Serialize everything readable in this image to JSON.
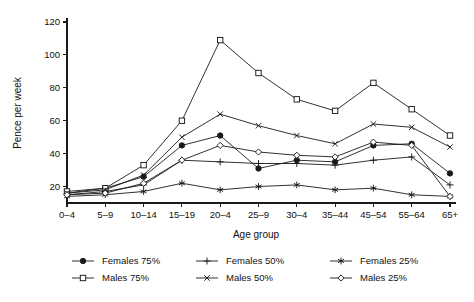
{
  "chart_data": {
    "type": "line",
    "title": "",
    "xlabel": "Age group",
    "ylabel": "Pence per week",
    "categories": [
      "0–4",
      "5–9",
      "10–14",
      "15–19",
      "20–4",
      "25–9",
      "30–4",
      "35–44",
      "45–54",
      "55–64",
      "65+"
    ],
    "ylim": [
      10,
      120
    ],
    "yticks": [
      20,
      40,
      60,
      80,
      100,
      120
    ],
    "ytick_labels": [
      "20",
      "40",
      "60",
      "80",
      "100",
      "120"
    ],
    "grid": false,
    "legend_position": "bottom",
    "series": [
      {
        "name": "Females 75%",
        "marker": "filled-circle",
        "values": [
          16,
          19,
          26,
          45,
          51,
          31,
          36,
          35,
          45,
          46,
          28
        ]
      },
      {
        "name": "Males 75%",
        "marker": "open-square",
        "values": [
          17,
          19,
          33,
          60,
          109,
          89,
          73,
          66,
          83,
          67,
          51
        ]
      },
      {
        "name": "Females 50%",
        "marker": "plus",
        "values": [
          15,
          17,
          21,
          36,
          35,
          34,
          34,
          33,
          36,
          38,
          21
        ]
      },
      {
        "name": "Males 50%",
        "marker": "cross",
        "values": [
          16,
          18,
          27,
          50,
          64,
          57,
          51,
          46,
          58,
          56,
          44
        ]
      },
      {
        "name": "Females 25%",
        "marker": "asterisk",
        "values": [
          14,
          15,
          17,
          22,
          18,
          20,
          21,
          18,
          19,
          15,
          14
        ]
      },
      {
        "name": "Males 25%",
        "marker": "open-diamond",
        "values": [
          15,
          16,
          22,
          36,
          45,
          41,
          39,
          38,
          47,
          45,
          14
        ]
      }
    ]
  },
  "legend": {
    "entries": [
      {
        "label": "Females 75%"
      },
      {
        "label": "Females 50%"
      },
      {
        "label": "Females 25%"
      },
      {
        "label": "Males 75%"
      },
      {
        "label": "Males 50%"
      },
      {
        "label": "Males 25%"
      }
    ]
  }
}
